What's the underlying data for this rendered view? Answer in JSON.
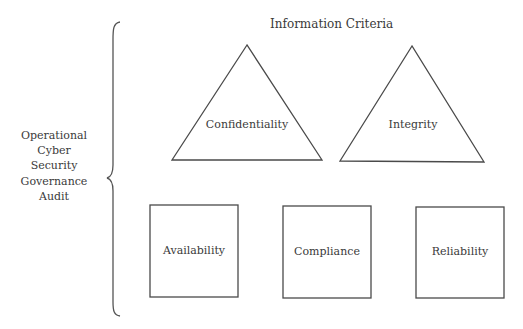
{
  "diagram": {
    "title": "Information Criteria",
    "left_group": {
      "lines": [
        "Operational",
        "Cyber",
        "Security",
        "Governance",
        "Audit"
      ]
    },
    "triangles": [
      {
        "label": "Confidentiality"
      },
      {
        "label": "Integrity"
      }
    ],
    "boxes": [
      {
        "label": "Availability"
      },
      {
        "label": "Compliance"
      },
      {
        "label": "Reliability"
      }
    ],
    "colors": {
      "stroke": "#4a4a4a",
      "text": "#3a3a3a",
      "background": "#ffffff"
    }
  }
}
